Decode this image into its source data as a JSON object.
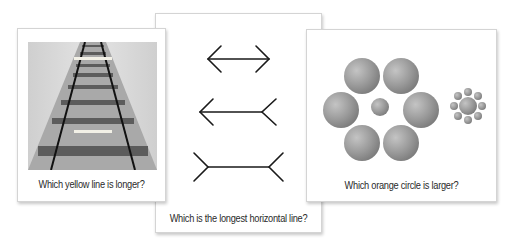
{
  "cards": [
    {
      "id": "railroad",
      "caption": "Which yellow line is longer?",
      "illusion": "ponzo",
      "image_icon": "railroad-track-icon",
      "line_color": "#f2f0e6"
    },
    {
      "id": "arrows",
      "caption": "Which is the longest horizontal line?",
      "illusion": "muller-lyer",
      "lines": [
        "arrows-inward",
        "arrow-left-fins-right",
        "fins-outward"
      ]
    },
    {
      "id": "circles",
      "caption": "Which orange circle is larger?",
      "illusion": "ebbinghaus",
      "circle_color": "#9a9a9a"
    }
  ]
}
